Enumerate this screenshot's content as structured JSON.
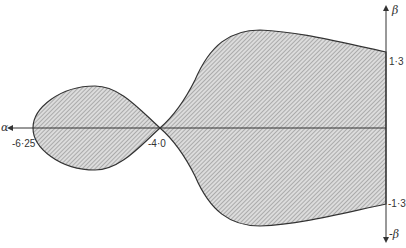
{
  "diagram": {
    "type": "stability-region",
    "x_axis": {
      "label": "α",
      "direction": "negative-left",
      "ticks": [
        {
          "value": -6.25,
          "label": "-6·25"
        },
        {
          "value": -4.0,
          "label": "-4·0"
        }
      ]
    },
    "y_axis": {
      "label_top": "β",
      "label_bottom": "-β",
      "ticks": [
        {
          "value": 1.3,
          "label": "1·3"
        },
        {
          "value": -1.3,
          "label": "-1·3"
        }
      ]
    },
    "regions": [
      {
        "name": "left-lobe",
        "x_range": [
          -6.25,
          -4.0
        ],
        "fill": "hatched"
      },
      {
        "name": "right-lobe",
        "x_range": [
          -4.0,
          0
        ],
        "fill": "hatched"
      }
    ],
    "colors": {
      "outline": "#333333",
      "hatch": "#777777",
      "fill": "#d6d6d6"
    }
  }
}
